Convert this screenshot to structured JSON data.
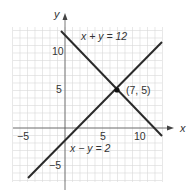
{
  "chart_data": {
    "type": "line",
    "title": "",
    "xlabel": "x",
    "ylabel": "y",
    "xlim": [
      -7,
      13
    ],
    "ylim": [
      -7,
      13
    ],
    "x_ticks": [
      -5,
      5,
      10
    ],
    "y_ticks": [
      -5,
      5,
      10
    ],
    "grid": true,
    "series": [
      {
        "name": "x + y = 12",
        "points": [
          [
            -1,
            13
          ],
          [
            13,
            -1
          ]
        ]
      },
      {
        "name": "x − y = 2",
        "points": [
          [
            -3,
            -5
          ],
          [
            13,
            11
          ]
        ]
      }
    ],
    "annotations": [
      {
        "text": "(7, 5)",
        "x": 7,
        "y": 5,
        "type": "point"
      }
    ]
  },
  "labels": {
    "x_axis": "x",
    "y_axis": "y",
    "line1": "x + y = 12",
    "line2": "x − y = 2",
    "point": "(7, 5)",
    "tick_x_neg5": "−5",
    "tick_x_5": "5",
    "tick_x_10": "10",
    "tick_y_neg5": "−5",
    "tick_y_5": "5",
    "tick_y_10": "10"
  },
  "colors": {
    "grid": "#d8d8d8",
    "axis": "#555555",
    "line": "#2a2a2a"
  }
}
